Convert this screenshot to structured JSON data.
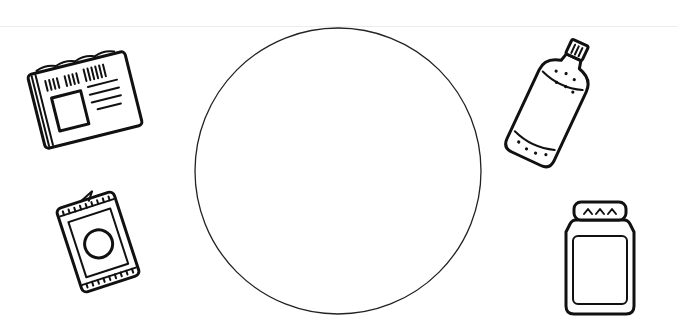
{
  "scene": {
    "description": "Sorting worksheet: a large empty circle surrounded by four item drawings",
    "background": "#ffffff",
    "ink_color": "#111111"
  },
  "sort_circle": {
    "cx": 338,
    "cy": 171,
    "r": 143,
    "stroke": "#222222"
  },
  "items": [
    {
      "id": "newspaper",
      "icon": "newspaper-icon",
      "position": "top-left"
    },
    {
      "id": "can",
      "icon": "tin-can-icon",
      "position": "bottom-left"
    },
    {
      "id": "bottle",
      "icon": "bottle-icon",
      "position": "top-right"
    },
    {
      "id": "jar",
      "icon": "jar-icon",
      "position": "bottom-right"
    }
  ]
}
